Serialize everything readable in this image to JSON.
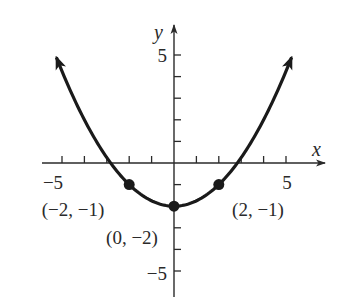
{
  "chart_data": {
    "type": "line",
    "title": "",
    "function": "y = x^2/4 - 2",
    "xlabel": "x",
    "ylabel": "y",
    "xlim": [
      -5.7,
      6.6
    ],
    "ylim": [
      -6.1,
      6.3
    ],
    "grid": false,
    "x_ticks": [
      -5,
      -4,
      -3,
      -2,
      -1,
      1,
      2,
      3,
      4,
      5
    ],
    "y_ticks": [
      -5,
      -4,
      -3,
      -2,
      -1,
      1,
      2,
      3,
      4,
      5
    ],
    "x_tick_labels": [
      {
        "value": -5,
        "text": "−5"
      },
      {
        "value": 5,
        "text": "5"
      }
    ],
    "y_tick_labels": [
      {
        "value": 5,
        "text": "5"
      },
      {
        "value": -5,
        "text": "−5"
      }
    ],
    "curve": {
      "x_range": [
        -5.25,
        5.25
      ],
      "arrows_at_ends": true,
      "color": "#1a1a1a"
    },
    "points": [
      {
        "x": -2,
        "y": -1,
        "label": "(−2, −1)"
      },
      {
        "x": 0,
        "y": -2,
        "label": "(0, −2)"
      },
      {
        "x": 2,
        "y": -1,
        "label": "(2, −1)"
      }
    ]
  }
}
